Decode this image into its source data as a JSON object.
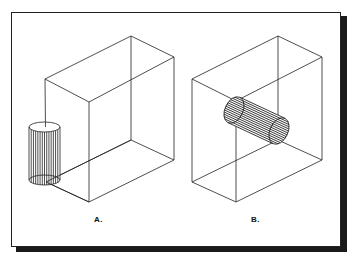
{
  "figure": {
    "frame": {
      "border_color": "#222222",
      "shadow_color": "#1a1a1a",
      "background": "#ffffff"
    },
    "panels": [
      {
        "id": "A",
        "label": "A.",
        "description": "Rectangular box in isometric wireframe with a vertical cylinder placed outside its bottom-left corner",
        "box": {
          "top": [
            [
              131,
              36
            ],
            [
              174,
              57
            ],
            [
              89,
              102
            ],
            [
              45,
              79
            ]
          ],
          "bottom": [
            [
              131,
              140
            ],
            [
              174,
              160
            ],
            [
              89,
              202
            ],
            [
              46,
              182
            ]
          ]
        },
        "cylinder": {
          "orientation": "vertical",
          "cx": 44.5,
          "rx": 15.5,
          "top_cy": 127,
          "bottom_cy": 180,
          "ry": 5,
          "hatch_count": 14
        }
      },
      {
        "id": "B",
        "label": "B.",
        "description": "Rectangular box in isometric wireframe with a horizontal cylinder passing through its front face",
        "box": {
          "top": [
            [
              278,
              36
            ],
            [
              322,
              57
            ],
            [
              236,
              101
            ],
            [
              192,
              79
            ]
          ],
          "bottom": [
            [
              278,
              140
            ],
            [
              322,
              160
            ],
            [
              236,
              202
            ],
            [
              192,
              182
            ]
          ]
        },
        "cylinder": {
          "orientation": "inclined",
          "end1": [
            234,
            110
          ],
          "end2": [
            279,
            131
          ],
          "rx": 9,
          "ry": 14,
          "hatch_count": 14
        }
      }
    ]
  }
}
